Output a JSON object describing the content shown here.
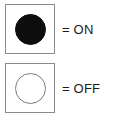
{
  "legend": {
    "title": "Indicator state legend",
    "items": [
      {
        "state": "on",
        "symbol_name": "filled-circle",
        "label": "= ON",
        "fill_color": "#0d0d0d",
        "box_border_color": "#8a8a8a",
        "box_fill_color": "#ffffff"
      },
      {
        "state": "off",
        "symbol_name": "hollow-circle",
        "label": "= OFF",
        "fill_color": "#ffffff",
        "outline_color": "#7d7d7d",
        "box_border_color": "#8a8a8a",
        "box_fill_color": "#ffffff"
      }
    ]
  },
  "page": {
    "background_color": "#ffffff",
    "text_color": "#1a1a1a"
  }
}
